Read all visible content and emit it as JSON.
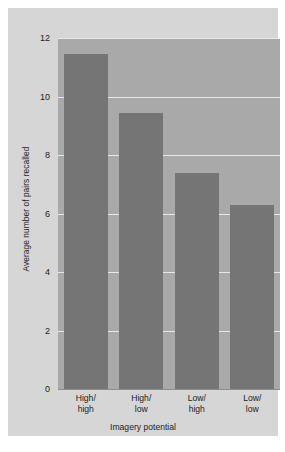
{
  "chart_data": {
    "type": "bar",
    "title": "",
    "subtitle": "",
    "categories": [
      "High/\nhigh",
      "High/\nlow",
      "Low/\nhigh",
      "Low/\nlow"
    ],
    "category_lines": [
      [
        "High/",
        "high"
      ],
      [
        "High/",
        "low"
      ],
      [
        "Low/",
        "high"
      ],
      [
        "Low/",
        "low"
      ]
    ],
    "values": [
      11.45,
      9.45,
      7.4,
      6.3
    ],
    "xlabel": "Imagery potential",
    "ylabel": "Average number of pairs recalled",
    "ylim": [
      0,
      12
    ],
    "yticks": [
      0,
      2,
      4,
      6,
      8,
      10,
      12
    ],
    "ytick_labels": [
      "0",
      "2",
      "4",
      "6",
      "8",
      "10",
      "12"
    ],
    "grid": "horizontal",
    "legend": "none",
    "colors": {
      "bar": "#757575",
      "plot_background": "#a9a9a9",
      "card_background": "#d6d6d6",
      "gridline": "#e8e8e8",
      "text": "#1d1d1d"
    }
  }
}
